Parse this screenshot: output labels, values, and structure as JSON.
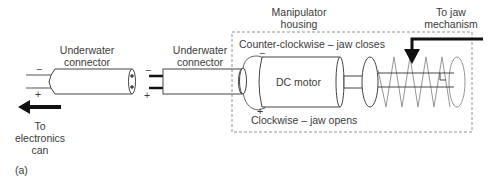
{
  "diagram": {
    "panel_label": "(a)",
    "left_connector": {
      "title_line1": "Underwater",
      "title_line2": "connector",
      "minus": "−",
      "plus": "+"
    },
    "right_connector": {
      "title_line1": "Underwater",
      "title_line2": "connector",
      "minus": "−",
      "plus": "+"
    },
    "housing": {
      "title_line1": "Manipulator",
      "title_line2": "housing"
    },
    "motor": {
      "label": "DC motor",
      "minus": "−",
      "plus": "+"
    },
    "direction_ccw": "Counter-clockwise – jaw closes",
    "direction_cw": "Clockwise – jaw opens",
    "jaw": {
      "line1": "To jaw",
      "line2": "mechanism"
    },
    "electronics": {
      "line1": "To",
      "line2": "electronics",
      "line3": "can"
    },
    "colors": {
      "stroke": "#4a4a4a",
      "arrow": "#111111",
      "spring": "#8a8a8a",
      "dashed_box": "#777777"
    }
  }
}
